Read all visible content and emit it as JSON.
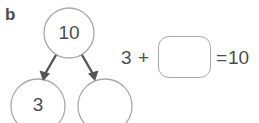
{
  "exercise": {
    "part_label": "b",
    "whole": "10",
    "part_a": "3",
    "part_b": "",
    "equation": {
      "addend": "3",
      "plus_sign": "+",
      "blank_value": "",
      "equals_sign": "=",
      "sum": "10"
    }
  },
  "colors": {
    "ink": "#4c4c4c",
    "outline": "#a9a9a9",
    "arrow": "#555555",
    "background": "#ffffff"
  },
  "icons": {
    "arrow_left": "arrow-down-left-icon",
    "arrow_right": "arrow-down-right-icon"
  }
}
